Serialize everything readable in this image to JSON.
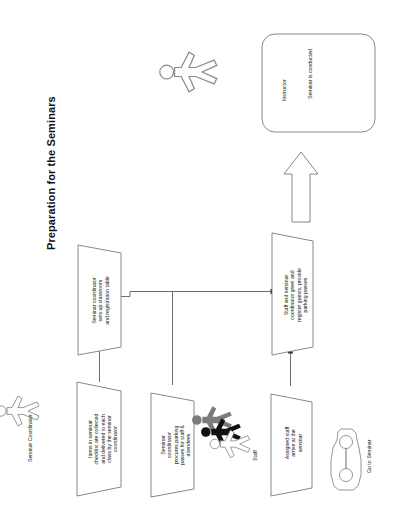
{
  "document": {
    "title": "Preparation for the Seminars",
    "orientation": "rotated-90-ccw",
    "background_color": "#ffffff",
    "line_color": "#7a7a7a"
  },
  "diagram": {
    "type": "flowchart",
    "swimlane_labels": [
      {
        "id": "seminar-coordinator",
        "text": "Seminar Coordinator"
      },
      {
        "id": "staff",
        "text": "Staff"
      },
      {
        "id": "instructor",
        "text": "Instructor"
      },
      {
        "id": "go-to-seminar",
        "text": "Go to Seminar"
      }
    ],
    "nodes": [
      {
        "id": "items-collected",
        "shape": "parallelogram",
        "text": "Items in seminar checklist are collected and delivered to each class by the seminar coordinator",
        "lines": [
          "Items in seminar",
          "checklist are collected",
          "and delivered to each",
          "class by the seminar",
          "coordinator"
        ]
      },
      {
        "id": "sets-up-classroom",
        "shape": "parallelogram",
        "text": "Seminar coordinator sets up classroom and registration table",
        "lines": [
          "Seminar  coordinator",
          "sets up classroom",
          "and registration table"
        ]
      },
      {
        "id": "procures-parking",
        "shape": "parallelogram",
        "text": "Seminar coordinator procures parking passes for staff & attendees",
        "lines": [
          "Seminar",
          "coordinator",
          "procures parking",
          "passes for staff &",
          "attendees"
        ]
      },
      {
        "id": "staff-arrive",
        "shape": "parallelogram",
        "text": "Assigned staff arrive at the seminar",
        "lines": [
          "Assigned staff",
          "arrive at the",
          "seminar"
        ]
      },
      {
        "id": "greet-register",
        "shape": "parallelogram",
        "text": "Staff and seminar coordinator greet and register guests, provide parking passes",
        "lines": [
          "Staff and seminar",
          "coordinator greet and",
          "register guests, provide",
          "parking passes"
        ]
      },
      {
        "id": "seminar-conducted",
        "shape": "rounded-rectangle",
        "text": "Seminar is conducted",
        "lines": [
          "Seminar is conducted"
        ]
      }
    ],
    "icons": [
      {
        "id": "coordinator-figure",
        "name": "person-icon",
        "color": "#ffffff"
      },
      {
        "id": "staff-figure-gray",
        "name": "person-icon",
        "color": "#7b7b7b"
      },
      {
        "id": "staff-figure-black",
        "name": "person-icon",
        "color": "#111111"
      },
      {
        "id": "staff-figure-white",
        "name": "person-icon",
        "color": "#ffffff"
      },
      {
        "id": "instructor-figure",
        "name": "person-icon",
        "color": "#ffffff"
      },
      {
        "id": "car",
        "name": "car-icon",
        "color": "#ffffff"
      },
      {
        "id": "big-arrow",
        "name": "block-arrow-up-icon",
        "color": "#ffffff"
      }
    ],
    "connectors": [
      {
        "from": "items-collected",
        "to": "sets-up-classroom",
        "style": "thin-arrow"
      },
      {
        "from": "sets-up-classroom",
        "to": "greet-register",
        "style": "thin-arrow"
      },
      {
        "from": "procures-parking",
        "to": "greet-register",
        "style": "thin-arrow-junction"
      },
      {
        "from": "staff-arrive",
        "to": "greet-register",
        "style": "thin-arrow"
      },
      {
        "from": "greet-register",
        "to": "seminar-conducted",
        "style": "block-arrow"
      }
    ]
  }
}
